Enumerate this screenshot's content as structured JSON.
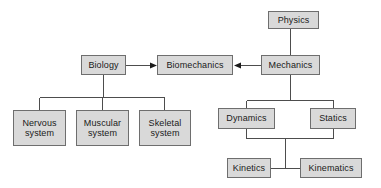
{
  "diagram": {
    "style": {
      "node_fill": "#d9d9d9",
      "node_border": "#6e6e6e",
      "line_color": "#4d4d4d",
      "text_color": "#1a1a1a",
      "background": "#ffffff"
    },
    "nodes": [
      {
        "id": "physics",
        "label": "Physics",
        "x": 268,
        "y": 11,
        "w": 51,
        "h": 18
      },
      {
        "id": "biology",
        "label": "Biology",
        "x": 81,
        "y": 55,
        "w": 45,
        "h": 20
      },
      {
        "id": "biomechanics",
        "label": "Biomechanics",
        "x": 157,
        "y": 55,
        "w": 76,
        "h": 20
      },
      {
        "id": "mechanics",
        "label": "Mechanics",
        "x": 261,
        "y": 55,
        "w": 59,
        "h": 20
      },
      {
        "id": "nervous",
        "label": "Nervous\nsystem",
        "x": 13,
        "y": 110,
        "w": 53,
        "h": 36
      },
      {
        "id": "muscular",
        "label": "Muscular\nsystem",
        "x": 76,
        "y": 110,
        "w": 53,
        "h": 36
      },
      {
        "id": "skeletal",
        "label": "Skeletal\nsystem",
        "x": 139,
        "y": 110,
        "w": 52,
        "h": 36
      },
      {
        "id": "dynamics",
        "label": "Dynamics",
        "x": 218,
        "y": 108,
        "w": 57,
        "h": 21
      },
      {
        "id": "statics",
        "label": "Statics",
        "x": 310,
        "y": 108,
        "w": 46,
        "h": 21
      },
      {
        "id": "kinetics",
        "label": "Kinetics",
        "x": 227,
        "y": 158,
        "w": 44,
        "h": 20
      },
      {
        "id": "kinematics",
        "label": "Kinematics",
        "x": 300,
        "y": 158,
        "w": 62,
        "h": 20
      }
    ],
    "connections": [
      {
        "from": "physics",
        "to": "mechanics",
        "kind": "vertical"
      },
      {
        "from": "biology",
        "to": "biomechanics",
        "kind": "arrow-right"
      },
      {
        "from": "mechanics",
        "to": "biomechanics",
        "kind": "arrow-left"
      },
      {
        "from": "biology",
        "to": "nervous",
        "kind": "bus-down"
      },
      {
        "from": "biology",
        "to": "muscular",
        "kind": "bus-down"
      },
      {
        "from": "biology",
        "to": "skeletal",
        "kind": "bus-down"
      },
      {
        "from": "mechanics",
        "to": "dynamics",
        "kind": "bus-down"
      },
      {
        "from": "mechanics",
        "to": "statics",
        "kind": "bus-down"
      },
      {
        "from": "dynamics",
        "to": "kinetics",
        "kind": "bus-down"
      },
      {
        "from": "statics",
        "to": "kinematics",
        "kind": "bus-down"
      }
    ]
  }
}
